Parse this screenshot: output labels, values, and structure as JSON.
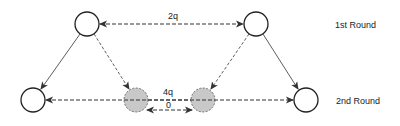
{
  "diagram": {
    "labels": {
      "top_edge": "2q",
      "bottom_edge_upper": "4q",
      "bottom_edge_lower": "0",
      "round1": "1st Round",
      "round2": "2nd Round"
    },
    "nodes": [
      {
        "id": "top-left",
        "cx": 87,
        "cy": 24,
        "fill": "#ffffff",
        "stroke": "solid"
      },
      {
        "id": "top-right",
        "cx": 256,
        "cy": 24,
        "fill": "#ffffff",
        "stroke": "solid"
      },
      {
        "id": "bottom-left",
        "cx": 33,
        "cy": 100,
        "fill": "#ffffff",
        "stroke": "solid"
      },
      {
        "id": "gray-1",
        "cx": 136,
        "cy": 100,
        "fill": "#c8c8c8",
        "stroke": "dashed"
      },
      {
        "id": "gray-2",
        "cx": 203,
        "cy": 100,
        "fill": "#c8c8c8",
        "stroke": "dashed"
      },
      {
        "id": "bottom-right",
        "cx": 306,
        "cy": 100,
        "fill": "#ffffff",
        "stroke": "solid"
      }
    ],
    "colors": {
      "line": "#333333",
      "gray_node": "#c8c8c8"
    }
  }
}
